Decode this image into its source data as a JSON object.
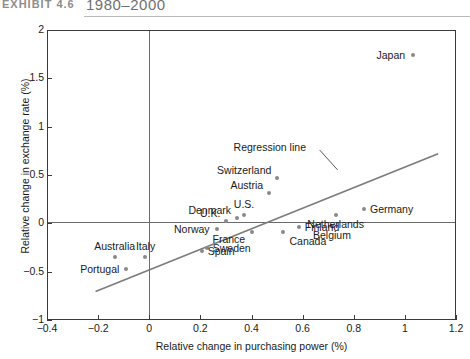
{
  "exhibit": {
    "number": "EXHIBIT 4.6",
    "title": "1980–2000"
  },
  "chart_data": {
    "type": "scatter",
    "title": "1980–2000",
    "xlabel": "Relative change in purchasing power (%)",
    "ylabel": "Relative change in exchange rate (%)",
    "xlim": [
      -0.4,
      1.2
    ],
    "ylim": [
      -1,
      2
    ],
    "xticks": [
      "-0.4",
      "-0.2",
      "0",
      "0.2",
      "0.4",
      "0.6",
      "0.8",
      "1",
      "1.2"
    ],
    "xtick_values": [
      -0.4,
      -0.2,
      0,
      0.2,
      0.4,
      0.6,
      0.8,
      1.0,
      1.2
    ],
    "yticks": [
      "2",
      "1.5",
      "1",
      "0.5",
      "0",
      "-0.5",
      "-1"
    ],
    "ytick_values": [
      2,
      1.5,
      1,
      0.5,
      0,
      -0.5,
      -1
    ],
    "grid": false,
    "legend": "none",
    "point_color": "#8a8a8a",
    "line_color": "#7d7d7d",
    "zero_lines": true,
    "annotations": [
      {
        "name": "regression-line-label",
        "text": "Regression line",
        "x": 0.33,
        "y": 0.78
      }
    ],
    "series": [
      {
        "name": "Countries",
        "points": [
          {
            "label": "Japan",
            "x": 1.03,
            "y": 1.74,
            "label_pos": "left"
          },
          {
            "label": "Switzerland",
            "x": 0.5,
            "y": 0.47,
            "label_pos": "left-up"
          },
          {
            "label": "Austria",
            "x": 0.47,
            "y": 0.31,
            "label_pos": "left-up"
          },
          {
            "label": "Germany",
            "x": 0.84,
            "y": 0.15,
            "label_pos": "right"
          },
          {
            "label": "Netherlands",
            "x": 0.73,
            "y": 0.09,
            "label_pos": "below"
          },
          {
            "label": "U.S.",
            "x": 0.37,
            "y": 0.09,
            "label_pos": "above"
          },
          {
            "label": "Denmark",
            "x": 0.345,
            "y": 0.06,
            "label_pos": "left-up"
          },
          {
            "label": "U.K.",
            "x": 0.3,
            "y": 0.02,
            "label_pos": "left-up"
          },
          {
            "label": "Belgium",
            "x": 0.715,
            "y": -0.03,
            "label_pos": "below"
          },
          {
            "label": "Finland",
            "x": 0.585,
            "y": -0.04,
            "label_pos": "right"
          },
          {
            "label": "Canada",
            "x": 0.525,
            "y": -0.09,
            "label_pos": "right-below"
          },
          {
            "label": "Norway",
            "x": 0.265,
            "y": -0.06,
            "label_pos": "left"
          },
          {
            "label": "France",
            "x": 0.4,
            "y": -0.09,
            "label_pos": "left-below"
          },
          {
            "label": "Sweden",
            "x": 0.225,
            "y": -0.25,
            "label_pos": "right"
          },
          {
            "label": "Spain",
            "x": 0.205,
            "y": -0.29,
            "label_pos": "right"
          },
          {
            "label": "Italy",
            "x": -0.015,
            "y": -0.35,
            "label_pos": "above"
          },
          {
            "label": "Australia",
            "x": -0.135,
            "y": -0.35,
            "label_pos": "above"
          },
          {
            "label": "Portugal",
            "x": -0.09,
            "y": -0.47,
            "label_pos": "left"
          }
        ]
      }
    ],
    "regression": {
      "x_start": -0.21,
      "y_start": -0.705,
      "x_end": 1.13,
      "y_end": 0.72
    }
  }
}
